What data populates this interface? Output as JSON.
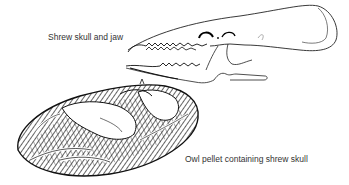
{
  "figure": {
    "labels": {
      "skull": "Shrew skull and jaw",
      "pellet": "Owl pellet containing shrew skull"
    },
    "colors": {
      "background": "#ffffff",
      "ink": "#111111",
      "text": "#333333"
    }
  }
}
